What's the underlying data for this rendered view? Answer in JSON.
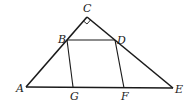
{
  "diagram": {
    "points": {
      "A": {
        "label": "A",
        "x": 26,
        "y": 87,
        "lx": 17,
        "ly": 91
      },
      "C": {
        "label": "C",
        "x": 87,
        "y": 17,
        "lx": 83,
        "ly": 12
      },
      "E": {
        "label": "E",
        "x": 173,
        "y": 88,
        "lx": 175,
        "ly": 92
      },
      "B": {
        "label": "B",
        "x": 67,
        "y": 40,
        "lx": 58,
        "ly": 42
      },
      "D": {
        "label": "D",
        "x": 115,
        "y": 40,
        "lx": 117,
        "ly": 43
      },
      "G": {
        "label": "G",
        "x": 73,
        "y": 87,
        "lx": 71,
        "ly": 99
      },
      "F": {
        "label": "F",
        "x": 124,
        "y": 88,
        "lx": 121,
        "ly": 99
      }
    },
    "segments": [
      "AC",
      "CE",
      "AE",
      "BD",
      "BG",
      "DF"
    ],
    "right_angle_marker": "C",
    "stroke_color": "#1a1a1a"
  }
}
